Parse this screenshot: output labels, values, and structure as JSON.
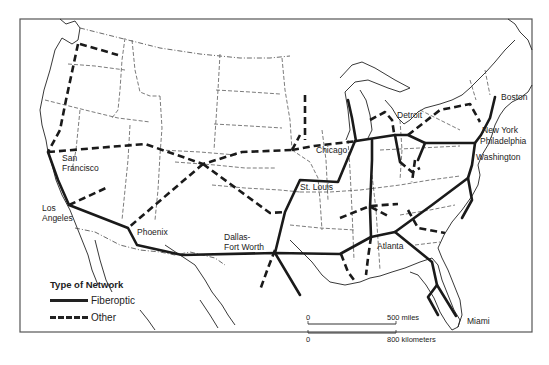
{
  "title": "Type of Network",
  "legend": {
    "title": "Type of Network",
    "items": [
      {
        "label": "Fiberoptic",
        "style": "solid"
      },
      {
        "label": "Other",
        "style": "dashed"
      }
    ]
  },
  "cities": [
    {
      "name": "Boston",
      "label": "Boston",
      "x": 499,
      "y": 97
    },
    {
      "name": "New York",
      "label": "New York",
      "x": 482,
      "y": 130
    },
    {
      "name": "Philadelphia",
      "label": "Philadelphia",
      "x": 481,
      "y": 140
    },
    {
      "name": "Washington",
      "label": "Washington",
      "x": 476,
      "y": 157
    },
    {
      "name": "Detroit",
      "label": "Detroit",
      "x": 398,
      "y": 116
    },
    {
      "name": "Chicago",
      "label": "Chicago",
      "x": 314,
      "y": 150
    },
    {
      "name": "St. Louis",
      "label": "St. Louis",
      "x": 300,
      "y": 182
    },
    {
      "name": "Atlanta",
      "label": "Atlanta",
      "x": 380,
      "y": 241
    },
    {
      "name": "Miami",
      "label": "Miami",
      "x": 470,
      "y": 319
    },
    {
      "name": "Dallas-Fort Worth",
      "label": "Dallas-\nFort Worth",
      "x": 223,
      "y": 233
    },
    {
      "name": "Phoenix",
      "label": "Phoenix",
      "x": 137,
      "y": 231
    },
    {
      "name": "Los Angeles",
      "label": "Los\nAngeles",
      "x": 42,
      "y": 205
    },
    {
      "name": "San Francisco",
      "label": "San\nFrancisco",
      "x": 62,
      "y": 151
    }
  ],
  "scale_bar": {
    "miles_zero": "0",
    "miles_label": "500 miles",
    "km_zero": "0",
    "km_label": "800 kilometers"
  },
  "colors": {
    "line": "#1a1a1a",
    "frame": "#555555",
    "background": "#ffffff"
  }
}
